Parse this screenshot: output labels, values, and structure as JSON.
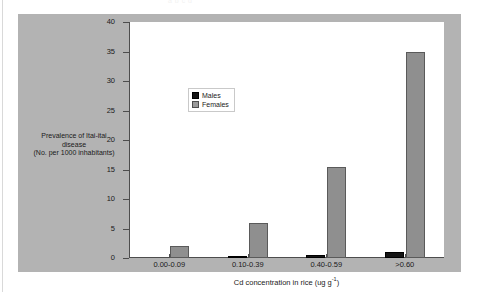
{
  "figure": {
    "bleed_text": "a b c d"
  },
  "chart_data": {
    "type": "bar",
    "title": "",
    "categories": [
      "0.00-0.09",
      "0.10-0.39",
      "0.40-0.59",
      ">0.60"
    ],
    "series": [
      {
        "name": "Males",
        "values": [
          0,
          0.2,
          0.5,
          1.1
        ],
        "color": "#141414"
      },
      {
        "name": "Females",
        "values": [
          2,
          6,
          15.5,
          35
        ],
        "color": "#8f8f8f"
      }
    ],
    "xlabel": "Cd concentration in rice (ug g",
    "xlabel_sup": "-1",
    "xlabel_end": ")",
    "ylabel_line1": "Prevalence of Itai-itai",
    "ylabel_line2": "disease",
    "ylabel_line3": "(No. per 1000 inhabitants)",
    "ylim": [
      0,
      40
    ],
    "yticks": [
      40,
      35,
      30,
      25,
      20,
      15,
      10,
      5,
      0
    ],
    "ytick_labels": [
      "40",
      "35",
      "30",
      "25",
      "20",
      "15",
      "10",
      "5",
      "0"
    ],
    "grid": false,
    "legend_position": "top-center-left"
  }
}
